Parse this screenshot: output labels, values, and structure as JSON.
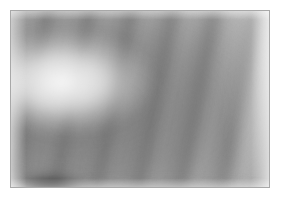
{
  "page": {
    "width": 281,
    "height": 201,
    "background_color": "#ffffff"
  },
  "frame": {
    "border_color": "#a8a8a8",
    "border_width": 1,
    "left": 10,
    "top": 10,
    "width": 260,
    "height": 178,
    "background_color": "#ffffff"
  },
  "image": {
    "name": "blurred-grayscale-photo",
    "palette": {
      "white": "#ffffff",
      "highlight": "#f5f5f5",
      "light_gray": "#d8d8d8",
      "mid_gray": "#a0a0a0",
      "dark_gray": "#5a5a5a",
      "darkest": "#1a1a1a"
    },
    "features": [
      {
        "name": "base-mass",
        "description": "broad soft mid-gray body of the object centered left of middle"
      },
      {
        "name": "diagonal-bands",
        "description": "repeating curved light and dark ridges running upper-left to lower-right"
      },
      {
        "name": "secondary-bands",
        "description": "softer second set of ridges at a slightly different angle"
      },
      {
        "name": "center-highlight",
        "description": "bright near-white specular highlight in the center-left"
      },
      {
        "name": "dark-blob-bottom-left",
        "description": "strongest dark blob near the lower-left of the object"
      },
      {
        "name": "dark-bottom-band",
        "description": "dark horizontal band sweeping across the bottom toward the right"
      },
      {
        "name": "dark-spots-top",
        "description": "two small dark spots touching the top border near the center"
      },
      {
        "name": "dark-left-arc",
        "description": "dark arc along the upper-left rim of the object"
      },
      {
        "name": "white-fade",
        "description": "object dissolves into white at the right edge and the bottom-left notch"
      }
    ]
  }
}
